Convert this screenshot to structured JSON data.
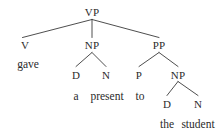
{
  "figure": {
    "name": "syntax-tree",
    "type": "constituency-parse-tree",
    "sentence": "gave a present to the student",
    "background_color": "#ffffff",
    "text_color": "#2b2b2b",
    "edge_color": "#3a3a3a"
  },
  "nodes": {
    "vp": "VP",
    "v": "V",
    "np1": "NP",
    "pp": "PP",
    "d1": "D",
    "n1": "N",
    "p": "P",
    "np2": "NP",
    "d2": "D",
    "n2": "N"
  },
  "terminals": {
    "gave": "gave",
    "a": "a",
    "present": "present",
    "to": "to",
    "the": "the",
    "student": "student"
  }
}
